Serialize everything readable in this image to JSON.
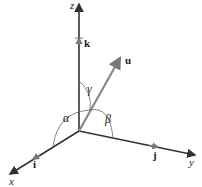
{
  "diagram": {
    "axes": {
      "x": {
        "label": "x",
        "unit_vector": "i"
      },
      "y": {
        "label": "y",
        "unit_vector": "j"
      },
      "z": {
        "label": "z",
        "unit_vector": "k"
      }
    },
    "vector": {
      "label": "u"
    },
    "angles": {
      "alpha": "α",
      "beta": "β",
      "gamma": "γ"
    },
    "colors": {
      "axis": "#333333",
      "vector": "#888888",
      "arc": "#666666",
      "text": "#222222"
    }
  }
}
